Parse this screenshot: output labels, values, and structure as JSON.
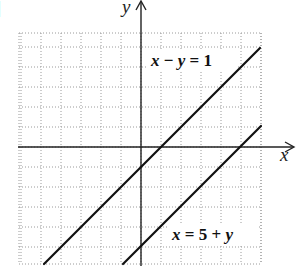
{
  "chart_data": {
    "type": "line",
    "title": "",
    "xlabel": "x",
    "ylabel": "y",
    "xlim": [
      -6,
      6
    ],
    "ylim": [
      -5.85,
      5.7
    ],
    "grid": true,
    "grid_step": 1,
    "series": [
      {
        "name": "x - y = 1",
        "equation": "y = x - 1",
        "points": [
          [
            -4.85,
            -5.85
          ],
          [
            5.95,
            4.95
          ]
        ]
      },
      {
        "name": "x = 5 + y",
        "equation": "y = x - 5",
        "points": [
          [
            -0.9,
            -5.85
          ],
          [
            6.0,
            1.05
          ]
        ]
      }
    ],
    "annotations": [
      {
        "text": "x − y = 1",
        "x": 0.5,
        "y": 4.05
      },
      {
        "text": "x = 5 + y",
        "x": 1.55,
        "y": -4.6
      }
    ]
  },
  "labels": {
    "x_axis": "x",
    "y_axis": "y",
    "eq1": {
      "var1": "x",
      "op1": " − ",
      "var2": "y",
      "rest": " = 1"
    },
    "eq2": {
      "var1": "x",
      "rest1": " = 5 + ",
      "var2": "y"
    },
    "bracket_fragment": "]"
  },
  "colors": {
    "line": "#111111",
    "axis": "#222222",
    "grid": "#9a9a9a",
    "background": "#ffffff"
  }
}
